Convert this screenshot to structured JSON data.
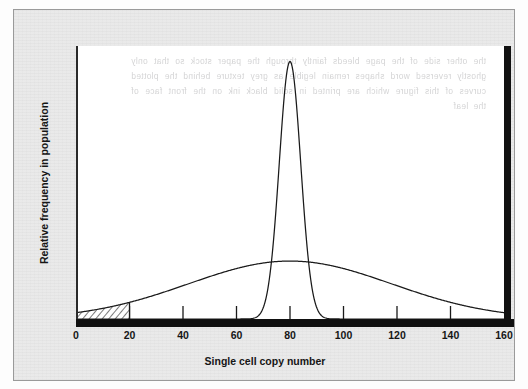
{
  "figure": {
    "kind": "scientific-figure",
    "panel_background": "#e9e9e9",
    "plot_background": "#ffffff",
    "ink_color": "#1a1a1a",
    "showthrough_text": "the other side of the page bleeds faintly through the paper stock so that only ghostly reversed word shapes remain legible as grey texture behind the plotted curves of this figure which are printed in solid black ink on the front face of the leaf"
  },
  "chart_data": {
    "type": "line",
    "title": "",
    "subtitle": "",
    "xlabel": "Single cell copy number",
    "ylabel": "Relative frequency in population",
    "xlim": [
      0,
      160
    ],
    "ylim": [
      0,
      1.06
    ],
    "grid": false,
    "legend_position": "none",
    "x_ticks": [
      0,
      20,
      40,
      60,
      80,
      100,
      120,
      140,
      160
    ],
    "x_tick_labels": [
      "0",
      "20",
      "40",
      "60",
      "80",
      "100",
      "120",
      "140",
      "160"
    ],
    "y_ticks": [],
    "y_tick_labels": [],
    "series": [
      {
        "name": "narrow distribution",
        "shape": "gaussian",
        "mean": 80,
        "sigma": 4.0,
        "peak_height": 1.0,
        "style": "solid",
        "x": [
          60,
          64,
          66,
          68,
          70,
          71,
          72,
          73,
          74,
          75,
          76,
          77,
          78,
          79,
          80,
          81,
          82,
          83,
          84,
          85,
          86,
          87,
          88,
          89,
          90,
          92,
          94,
          96,
          100
        ],
        "values": [
          0.0,
          0.0,
          0.001,
          0.005,
          0.022,
          0.044,
          0.082,
          0.141,
          0.227,
          0.338,
          0.465,
          0.594,
          0.707,
          0.792,
          0.84,
          0.792,
          0.707,
          0.594,
          0.465,
          0.338,
          0.227,
          0.141,
          0.082,
          0.044,
          0.022,
          0.005,
          0.001,
          0.0,
          0.0
        ]
      },
      {
        "name": "broad distribution",
        "shape": "gaussian",
        "mean": 80,
        "sigma": 38.0,
        "peak_height": 0.225,
        "style": "solid",
        "x": [
          0,
          10,
          20,
          30,
          40,
          50,
          60,
          70,
          80,
          90,
          100,
          110,
          120,
          130,
          140,
          150,
          160
        ],
        "values": [
          0.032,
          0.055,
          0.086,
          0.122,
          0.158,
          0.189,
          0.21,
          0.222,
          0.225,
          0.222,
          0.21,
          0.189,
          0.158,
          0.122,
          0.086,
          0.055,
          0.032
        ]
      }
    ],
    "annotations": [
      {
        "name": "hatched-region",
        "kind": "shaded-area",
        "fill": "diagonal-hatch",
        "under_series": "broad distribution",
        "x_from": 0,
        "x_to": 20,
        "boundary_line_at_x": 20,
        "label": ""
      }
    ]
  },
  "axes": {
    "x_title": "Single cell copy number",
    "y_title": "Relative frequency in population"
  }
}
